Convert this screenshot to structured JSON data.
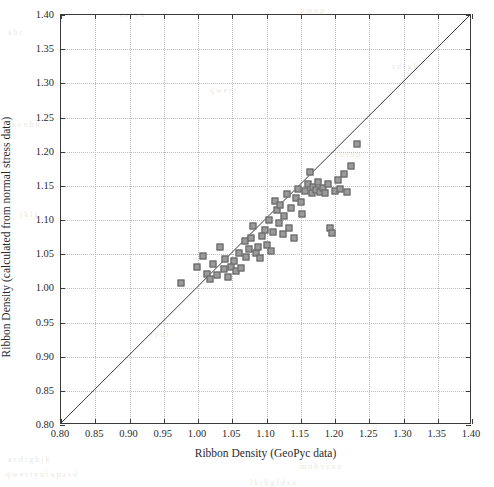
{
  "chart_data": {
    "type": "scatter",
    "title": "",
    "xlabel": "Ribbon Density (GeoPyc data)",
    "ylabel": "Ribbon Density (calculated from normal stress data)",
    "xlim": [
      0.8,
      1.4
    ],
    "ylim": [
      0.8,
      1.4
    ],
    "xticks": [
      0.8,
      0.85,
      0.9,
      0.95,
      1.0,
      1.05,
      1.1,
      1.15,
      1.2,
      1.25,
      1.3,
      1.35,
      1.4
    ],
    "yticks": [
      0.8,
      0.85,
      0.9,
      0.95,
      1.0,
      1.05,
      1.1,
      1.15,
      1.2,
      1.25,
      1.3,
      1.35,
      1.4
    ],
    "xtick_labels": [
      "0.80",
      "0.85",
      "0.90",
      "0.95",
      "1.00",
      "1.05",
      "1.10",
      "1.15",
      "1.20",
      "1.25",
      "1.30",
      "1.35",
      "1.40"
    ],
    "ytick_labels": [
      "0.80",
      "0.85",
      "0.90",
      "0.95",
      "1.00",
      "1.05",
      "1.10",
      "1.15",
      "1.20",
      "1.25",
      "1.30",
      "1.35",
      "1.40"
    ],
    "grid": true,
    "grid_style": "dotted",
    "grid_color": "#bdbdbd",
    "legend": null,
    "marker_style": "square",
    "marker_face_color": "#9a9a9a",
    "marker_edge_color": "#5e5e5e",
    "marker_size_px": 7,
    "reference_line": {
      "name": "parity-line",
      "label": "1:1 line",
      "from": [
        0.8,
        0.8
      ],
      "to": [
        1.4,
        1.4
      ],
      "color": "#3a3a3a"
    },
    "series": [
      {
        "name": "Ribbon density comparison",
        "points": [
          [
            0.975,
            1.008
          ],
          [
            0.998,
            1.031
          ],
          [
            1.008,
            1.047
          ],
          [
            1.013,
            1.021
          ],
          [
            1.018,
            1.013
          ],
          [
            1.022,
            1.035
          ],
          [
            1.028,
            1.02
          ],
          [
            1.032,
            1.06
          ],
          [
            1.038,
            1.028
          ],
          [
            1.04,
            1.043
          ],
          [
            1.044,
            1.016
          ],
          [
            1.048,
            1.031
          ],
          [
            1.052,
            1.04
          ],
          [
            1.056,
            1.026
          ],
          [
            1.06,
            1.052
          ],
          [
            1.063,
            1.03
          ],
          [
            1.068,
            1.07
          ],
          [
            1.07,
            1.046
          ],
          [
            1.074,
            1.058
          ],
          [
            1.078,
            1.073
          ],
          [
            1.08,
            1.091
          ],
          [
            1.084,
            1.052
          ],
          [
            1.088,
            1.06
          ],
          [
            1.09,
            1.044
          ],
          [
            1.094,
            1.077
          ],
          [
            1.098,
            1.086
          ],
          [
            1.1,
            1.063
          ],
          [
            1.104,
            1.1
          ],
          [
            1.106,
            1.055
          ],
          [
            1.11,
            1.082
          ],
          [
            1.113,
            1.128
          ],
          [
            1.116,
            1.114
          ],
          [
            1.118,
            1.095
          ],
          [
            1.12,
            1.122
          ],
          [
            1.124,
            1.079
          ],
          [
            1.126,
            1.106
          ],
          [
            1.13,
            1.138
          ],
          [
            1.133,
            1.088
          ],
          [
            1.136,
            1.118
          ],
          [
            1.14,
            1.073
          ],
          [
            1.143,
            1.132
          ],
          [
            1.146,
            1.146
          ],
          [
            1.15,
            1.126
          ],
          [
            1.152,
            1.109
          ],
          [
            1.156,
            1.142
          ],
          [
            1.16,
            1.152
          ],
          [
            1.163,
            1.17
          ],
          [
            1.166,
            1.14
          ],
          [
            1.168,
            1.148
          ],
          [
            1.172,
            1.144
          ],
          [
            1.175,
            1.156
          ],
          [
            1.178,
            1.141
          ],
          [
            1.182,
            1.147
          ],
          [
            1.186,
            1.139
          ],
          [
            1.19,
            1.152
          ],
          [
            1.193,
            1.088
          ],
          [
            1.196,
            1.081
          ],
          [
            1.2,
            1.143
          ],
          [
            1.204,
            1.158
          ],
          [
            1.208,
            1.146
          ],
          [
            1.213,
            1.167
          ],
          [
            1.218,
            1.141
          ],
          [
            1.224,
            1.179
          ],
          [
            1.232,
            1.211
          ]
        ]
      }
    ]
  },
  "scan_artifacts": [
    {
      "text": "a b  c",
      "x": 8,
      "y": 28
    },
    {
      "text": "e r  t y u",
      "x": 120,
      "y": 10
    },
    {
      "text": "n m  o p",
      "x": 300,
      "y": 6
    },
    {
      "text": "x c v  b n",
      "x": 12,
      "y": 120
    },
    {
      "text": "q w e r t",
      "x": 210,
      "y": 86
    },
    {
      "text": "s d f  g h",
      "x": 392,
      "y": 62
    },
    {
      "text": "j k l  z",
      "x": 20,
      "y": 210
    },
    {
      "text": "u i o  p",
      "x": 340,
      "y": 150
    },
    {
      "text": "t y u i",
      "x": 150,
      "y": 330
    },
    {
      "text": "a s d f g h j k",
      "x": 8,
      "y": 455
    },
    {
      "text": "q w e r t y u i o p a s d",
      "x": 6,
      "y": 470
    },
    {
      "text": "m n b v c x z",
      "x": 300,
      "y": 462
    },
    {
      "text": "l k j h g f d s a",
      "x": 250,
      "y": 478
    }
  ]
}
